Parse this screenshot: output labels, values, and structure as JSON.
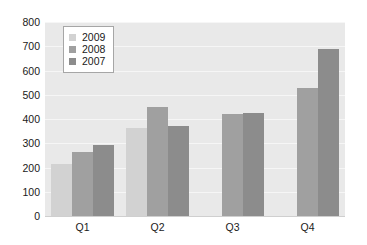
{
  "chart_data": {
    "type": "bar",
    "title": "",
    "xlabel": "",
    "ylabel": "",
    "categories": [
      "Q1",
      "Q2",
      "Q3",
      "Q4"
    ],
    "series": [
      {
        "name": "2009",
        "color": "#d2d2d2",
        "values": [
          215,
          365,
          null,
          null
        ]
      },
      {
        "name": "2008",
        "color": "#a0a0a0",
        "values": [
          265,
          448,
          422,
          527
        ]
      },
      {
        "name": "2007",
        "color": "#8c8c8c",
        "values": [
          293,
          370,
          424,
          690
        ]
      }
    ],
    "ylim": [
      0,
      800
    ],
    "ytick_values": [
      800,
      700,
      600,
      500,
      400,
      300,
      200,
      100,
      0
    ],
    "ytick_labels": [
      "800",
      "700",
      "600",
      "500",
      "400",
      "300",
      "200",
      "100",
      "0"
    ],
    "grid": true,
    "legend_position": "top-left",
    "plot_background": "#e9e9e9",
    "page_background": "#ffffff",
    "gridline_color": "#f6f6f6",
    "axis_color": "#cfcfcf"
  }
}
